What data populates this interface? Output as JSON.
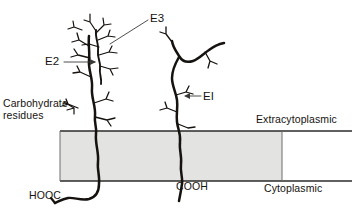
{
  "figure": {
    "type": "membrane-protein-topology-diagram",
    "background_color": "#ffffff",
    "ink_color": "#15120f",
    "membrane_fill": "#e3e3e1",
    "membrane_border": "#3a3a38"
  },
  "labels": {
    "e3": "E3",
    "e2": "E2",
    "e1": "EI",
    "carbohydrate": "Carbohydrate\nresidues",
    "extracytoplasmic": "Extracytoplasmic",
    "cytoplasmic": "Cytoplasmic",
    "hooc": "HOOC",
    "cooh": "COOH"
  },
  "membrane": {
    "x": 60,
    "y": 131,
    "width": 222,
    "height": 50,
    "top_line_extends_to": 352,
    "bottom_line_extends_to": 352
  },
  "chains": [
    {
      "name": "E2",
      "side": "left",
      "terminus_label": "HOOC",
      "branch_count": 6,
      "crosses_membrane": true
    },
    {
      "name": "E3",
      "side": "left",
      "note": "thin chain overlapping E2 in extracytoplasmic space",
      "branch_count": 7,
      "crosses_membrane": false
    },
    {
      "name": "EI",
      "side": "right",
      "terminus_label": "COOH",
      "branch_count": 5,
      "crosses_membrane": true
    }
  ],
  "leader_lines": [
    {
      "label": "E3",
      "from": [
        148,
        20
      ],
      "to": [
        110,
        44
      ]
    },
    {
      "label": "E2",
      "from": [
        64,
        62
      ],
      "to": [
        97,
        62
      ],
      "arrow": true
    },
    {
      "label": "EI",
      "from": [
        201,
        96
      ],
      "to": [
        184,
        96
      ],
      "arrow": true
    },
    {
      "label": "Carbohydrate residues",
      "from": [
        66,
        104
      ],
      "to": [
        83,
        108
      ]
    }
  ]
}
